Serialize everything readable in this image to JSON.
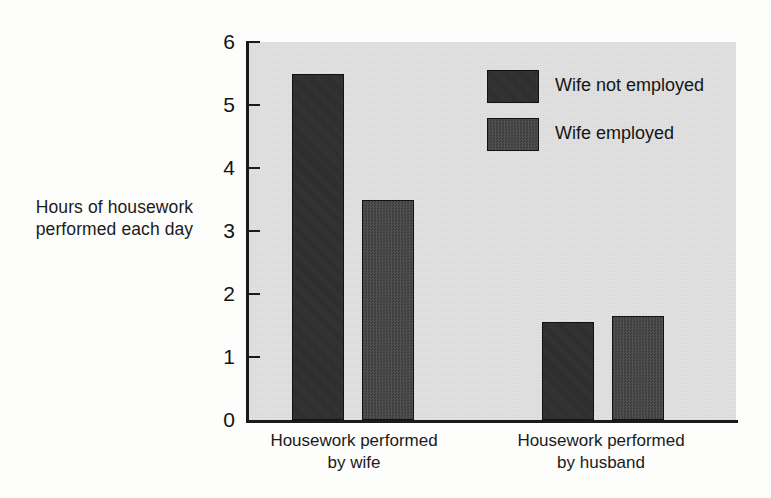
{
  "chart_data": {
    "type": "bar",
    "title": "",
    "xlabel": "",
    "ylabel": "Hours of housework\nperformed each day",
    "ylim": [
      0,
      6
    ],
    "ytick_labels": [
      "0",
      "1",
      "2",
      "3",
      "4",
      "5",
      "6"
    ],
    "ytick_values": [
      0,
      1,
      2,
      3,
      4,
      5,
      6
    ],
    "grid": false,
    "legend_position": "upper-right-inside",
    "categories": [
      "Housework performed\nby wife",
      "Housework performed\nby husband"
    ],
    "series": [
      {
        "name": "Wife not employed",
        "values": [
          5.5,
          1.55
        ],
        "color": "#2c2c2c"
      },
      {
        "name": "Wife employed",
        "values": [
          3.5,
          1.65
        ],
        "color": "#3c3c3c"
      }
    ]
  },
  "style": {
    "plot_background": "#dcdcdc",
    "page_background": "#fdfdfc",
    "axis_color": "#1a1a1a",
    "text_color": "#1b1b1b"
  }
}
